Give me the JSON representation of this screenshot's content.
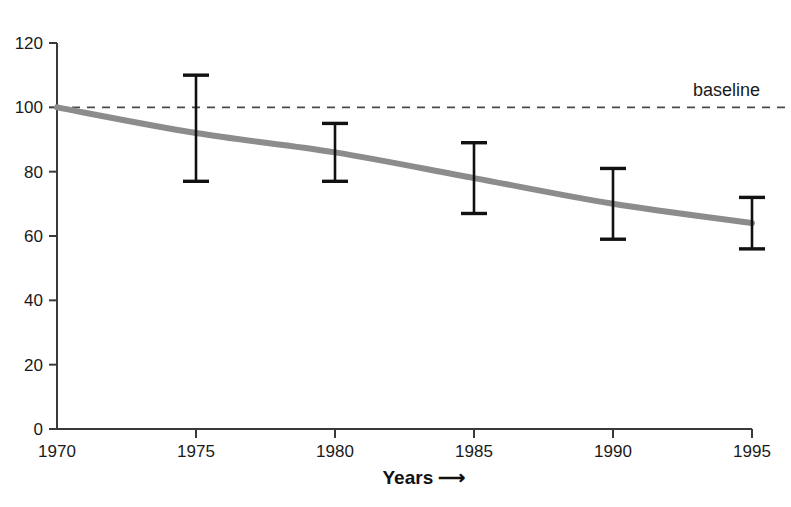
{
  "chart_data": {
    "type": "line",
    "title": "",
    "xlabel": "Years ⟶",
    "ylabel": "",
    "x": [
      1970,
      1975,
      1980,
      1985,
      1990,
      1995
    ],
    "xlim": [
      1970,
      1995
    ],
    "ylim": [
      0,
      120
    ],
    "grid": false,
    "legend": "none",
    "x_tick_labels": [
      "1970",
      "1975",
      "1980",
      "1985",
      "1990",
      "1995"
    ],
    "y_tick_labels": [
      "0",
      "20",
      "40",
      "60",
      "80",
      "100",
      "120"
    ],
    "y_ticks": [
      0,
      20,
      40,
      60,
      80,
      100,
      120
    ],
    "series": [
      {
        "name": "trend",
        "style": "line",
        "color": "#8c8c8c",
        "linewidth": 6,
        "x": [
          1970,
          1975,
          1980,
          1985,
          1990,
          1995
        ],
        "values": [
          100,
          92,
          86,
          78,
          70,
          64
        ]
      }
    ],
    "error_bars": [
      {
        "x": 1975,
        "value": 92,
        "upper": 110,
        "lower": 77
      },
      {
        "x": 1980,
        "value": 86,
        "upper": 95,
        "lower": 77
      },
      {
        "x": 1985,
        "value": 78,
        "upper": 89,
        "lower": 67
      },
      {
        "x": 1990,
        "value": 70,
        "upper": 81,
        "lower": 59
      },
      {
        "x": 1995,
        "value": 64,
        "upper": 72,
        "lower": 56
      }
    ],
    "reference_lines": [
      {
        "name": "baseline",
        "label": "baseline",
        "orientation": "horizontal",
        "value": 100,
        "style": "dashed",
        "color": "#4a4a4a"
      }
    ],
    "annotations": [
      {
        "name": "baseline-label",
        "text": "baseline"
      }
    ],
    "colors": {
      "axis": "#3a3a3a",
      "trend_line": "#8c8c8c",
      "error_bar": "#111111",
      "baseline": "#4a4a4a",
      "text": "#1a1a1a",
      "background": "#ffffff"
    }
  }
}
